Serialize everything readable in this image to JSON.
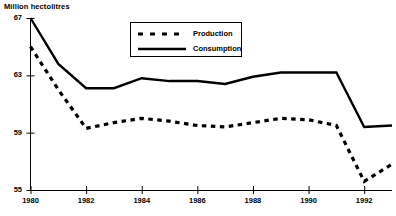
{
  "chart_data": {
    "type": "line",
    "title": "",
    "subtitle": "",
    "ylabel": "Million hectolitres",
    "xlabel": "",
    "ylim": [
      55,
      67
    ],
    "xlim": [
      1980,
      1993
    ],
    "yticks": [
      67,
      63,
      59,
      55
    ],
    "xticks": [
      1980,
      1982,
      1984,
      1986,
      1988,
      1990,
      1992
    ],
    "ytick_labels": [
      "67",
      "63",
      "59",
      "55"
    ],
    "xtick_labels": [
      "1980",
      "1982",
      "1984",
      "1986",
      "1988",
      "1990",
      "1992"
    ],
    "grid": false,
    "legend_position": "top-center",
    "x": [
      1980,
      1981,
      1982,
      1983,
      1984,
      1985,
      1986,
      1987,
      1988,
      1989,
      1990,
      1991,
      1992,
      1993
    ],
    "series": [
      {
        "name": "Production",
        "style": "dashed",
        "color": "#000000",
        "values": [
          65.0,
          62.0,
          59.3,
          59.7,
          60.0,
          59.8,
          59.5,
          59.4,
          59.7,
          60.0,
          59.9,
          59.5,
          55.6,
          56.8
        ]
      },
      {
        "name": "Consumption",
        "style": "solid",
        "color": "#000000",
        "values": [
          67.0,
          63.8,
          62.1,
          62.1,
          62.8,
          62.6,
          62.6,
          62.4,
          62.9,
          63.2,
          63.2,
          63.2,
          59.4,
          59.5
        ]
      }
    ],
    "legend": [
      {
        "label": "Production",
        "style": "dashed"
      },
      {
        "label": "Consumption",
        "style": "solid"
      }
    ]
  },
  "axis": {
    "title": "Million hectolitres"
  }
}
